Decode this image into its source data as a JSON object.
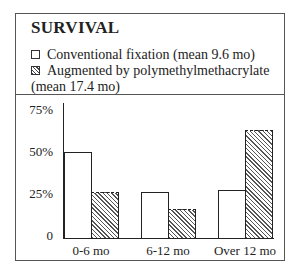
{
  "chart_data": {
    "type": "bar",
    "title": "SURVIVAL",
    "categories": [
      "0-6 mo",
      "6-12 mo",
      "Over 12 mo"
    ],
    "series": [
      {
        "name": "Conventional fixation (mean 9.6 mo)",
        "pattern": "white",
        "values": [
          50,
          27,
          28
        ]
      },
      {
        "name": "Augmented by polymethylmethacrylate (mean 17.4 mo)",
        "pattern": "hatched",
        "values": [
          27,
          17,
          63
        ]
      }
    ],
    "yticks": [
      "0",
      "25%",
      "50%",
      "75%"
    ],
    "ylim": [
      0,
      75
    ],
    "xlabel": "",
    "ylabel": "",
    "grid": false,
    "legend_position": "top"
  },
  "legend": {
    "item1": "Conventional fixation (mean 9.6 mo)",
    "item2_line1": "Augmented by polymethylmethacrylate",
    "item2_line2": "(mean 17.4 mo)"
  }
}
